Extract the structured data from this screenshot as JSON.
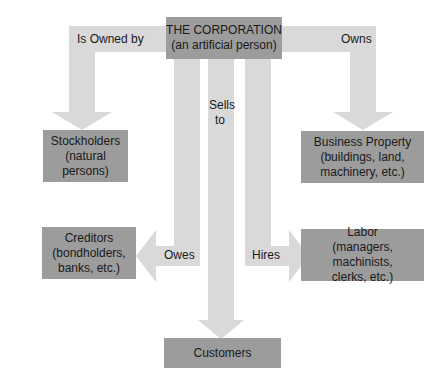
{
  "diagram": {
    "center": {
      "line1": "THE CORPORATION",
      "line2": "(an artificial person)"
    },
    "nodes": {
      "stockholders": {
        "line1": "Stockholders",
        "line2": "(natural",
        "line3": "persons)"
      },
      "business_property": {
        "line1": "Business Property",
        "line2": "(buildings, land,",
        "line3": "machinery, etc.)"
      },
      "creditors": {
        "line1": "Creditors",
        "line2": "(bondholders,",
        "line3": "banks, etc.)"
      },
      "labor": {
        "line1": "Labor",
        "line2": "(managers, machinists,",
        "line3": "clerks, etc.)"
      },
      "customers": {
        "line1": "Customers"
      }
    },
    "edges": {
      "is_owned_by": "Is Owned by",
      "owns": "Owns",
      "sells_to_1": "Sells",
      "sells_to_2": "to",
      "owes": "Owes",
      "hires": "Hires"
    },
    "colors": {
      "arrow": "#d9d9d9",
      "box": "#9c9c9c",
      "text": "#1a1a1a"
    }
  }
}
